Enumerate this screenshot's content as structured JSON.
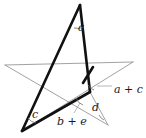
{
  "figure": {
    "canvas": {
      "width": 146,
      "height": 138
    },
    "colors": {
      "background": "#ffffff",
      "thick_stroke": "#111111",
      "thin_stroke": "#8a8a8a",
      "arc_stroke": "#6f6f6f",
      "leader_stroke": "#9a9a9a",
      "label_fill": "#1a1a1a"
    },
    "points": {
      "apex_top": {
        "x": 80,
        "y": 5
      },
      "left_outer": {
        "x": 5,
        "y": 65
      },
      "right_outer": {
        "x": 133,
        "y": 62
      },
      "bottom_left": {
        "x": 22,
        "y": 131
      },
      "bottom_right": {
        "x": 108,
        "y": 125
      },
      "inner_upper_left": {
        "x": 58,
        "y": 69
      },
      "inner_upper_right": {
        "x": 93,
        "y": 67
      },
      "inner_right": {
        "x": 90,
        "y": 92
      },
      "inner_lower": {
        "x": 72,
        "y": 104
      },
      "inner_left": {
        "x": 44,
        "y": 82
      }
    },
    "labels": [
      {
        "id": "angle-a",
        "text": "a",
        "x": 78,
        "y": 28,
        "kind": "single"
      },
      {
        "id": "angle-a-c",
        "lead": "a",
        "op": " + ",
        "trail": "c",
        "x": 114,
        "y": 90,
        "kind": "sum"
      },
      {
        "id": "angle-d",
        "text": "d",
        "x": 92,
        "y": 108,
        "kind": "single"
      },
      {
        "id": "angle-b-e",
        "lead": "b",
        "op": " + ",
        "trail": "e",
        "x": 57,
        "y": 122,
        "kind": "sum"
      },
      {
        "id": "angle-c",
        "text": "c",
        "x": 32,
        "y": 115,
        "kind": "single"
      }
    ],
    "edges": {
      "thick": [
        {
          "id": "apex-to-bottom-left",
          "from": "apex_top",
          "to": "bottom_left"
        },
        {
          "id": "apex-to-inner-right",
          "from": "apex_top",
          "to": "inner_right"
        },
        {
          "id": "bottom-left-to-right",
          "from": "bottom_left",
          "to": "inner_right"
        }
      ],
      "thin": [
        {
          "id": "left-outer-to-right-outer",
          "from": "left_outer",
          "to": "right_outer"
        },
        {
          "id": "left-outer-to-bottom-right",
          "from": "left_outer",
          "to": "bottom_right"
        },
        {
          "id": "right-outer-to-bottom-left",
          "from": "right_outer",
          "to": "bottom_left"
        },
        {
          "id": "inner-right-to-bottom-right",
          "from": "inner_right",
          "to": "bottom_right"
        }
      ]
    },
    "annotations": {
      "leader_a_c": {
        "from_x": 97,
        "from_y": 86,
        "to_x": 112,
        "to_y": 86
      },
      "leader_b_e": {
        "from_x": 74,
        "from_y": 113,
        "to_x": 80,
        "to_y": 103
      }
    }
  }
}
